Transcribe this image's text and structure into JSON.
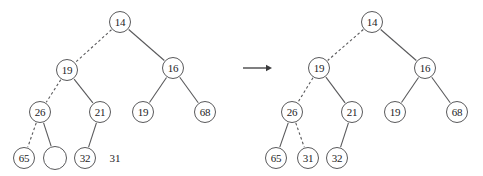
{
  "figure": {
    "kind": "binary-search-tree-insertion-diagram",
    "background_color": "#ffffff",
    "stroke_color": "#59595b",
    "text_color": "#232325",
    "node_radius": 11,
    "node_font_size": 11,
    "transition_arrow": {
      "name": "transition-arrow",
      "glyph": "→",
      "x1": 243,
      "y1": 68,
      "x2": 272,
      "y2": 68
    },
    "loose_labels": [
      {
        "id": "pending-key-31",
        "text": "31",
        "x": 115,
        "y": 158,
        "font_size": 11
      }
    ]
  },
  "trees": [
    {
      "id": "tree-before",
      "caption": "",
      "nodes": [
        {
          "id": "l-14",
          "label": "14",
          "x": 120,
          "y": 22,
          "r": 11,
          "empty": false
        },
        {
          "id": "l-19a",
          "label": "19",
          "x": 67,
          "y": 70,
          "r": 11,
          "empty": false
        },
        {
          "id": "l-16",
          "label": "16",
          "x": 173,
          "y": 68,
          "r": 11,
          "empty": false
        },
        {
          "id": "l-26",
          "label": "26",
          "x": 40,
          "y": 112,
          "r": 11,
          "empty": false
        },
        {
          "id": "l-21",
          "label": "21",
          "x": 100,
          "y": 112,
          "r": 11,
          "empty": false
        },
        {
          "id": "l-19b",
          "label": "19",
          "x": 143,
          "y": 112,
          "r": 11,
          "empty": false
        },
        {
          "id": "l-68",
          "label": "68",
          "x": 205,
          "y": 112,
          "r": 11,
          "empty": false
        },
        {
          "id": "l-65",
          "label": "65",
          "x": 24,
          "y": 158,
          "r": 11,
          "empty": false
        },
        {
          "id": "l-empty",
          "label": "",
          "x": 55,
          "y": 158,
          "r": 12,
          "empty": true
        },
        {
          "id": "l-32",
          "label": "32",
          "x": 85,
          "y": 158,
          "r": 11,
          "empty": false
        }
      ],
      "edges": [
        {
          "from": "l-14",
          "to": "l-19a",
          "style": "dashed"
        },
        {
          "from": "l-14",
          "to": "l-16",
          "style": "solid"
        },
        {
          "from": "l-19a",
          "to": "l-26",
          "style": "dashed"
        },
        {
          "from": "l-19a",
          "to": "l-21",
          "style": "solid"
        },
        {
          "from": "l-16",
          "to": "l-19b",
          "style": "solid"
        },
        {
          "from": "l-16",
          "to": "l-68",
          "style": "solid"
        },
        {
          "from": "l-26",
          "to": "l-65",
          "style": "dashed"
        },
        {
          "from": "l-26",
          "to": "l-empty",
          "style": "solid"
        },
        {
          "from": "l-21",
          "to": "l-32",
          "style": "solid"
        }
      ]
    },
    {
      "id": "tree-after",
      "caption": "",
      "nodes": [
        {
          "id": "r-14",
          "label": "14",
          "x": 372,
          "y": 22,
          "r": 11,
          "empty": false
        },
        {
          "id": "r-19a",
          "label": "19",
          "x": 319,
          "y": 68,
          "r": 11,
          "empty": false
        },
        {
          "id": "r-16",
          "label": "16",
          "x": 425,
          "y": 68,
          "r": 11,
          "empty": false
        },
        {
          "id": "r-26",
          "label": "26",
          "x": 292,
          "y": 112,
          "r": 11,
          "empty": false
        },
        {
          "id": "r-21",
          "label": "21",
          "x": 352,
          "y": 112,
          "r": 11,
          "empty": false
        },
        {
          "id": "r-19b",
          "label": "19",
          "x": 395,
          "y": 112,
          "r": 11,
          "empty": false
        },
        {
          "id": "r-68",
          "label": "68",
          "x": 457,
          "y": 112,
          "r": 11,
          "empty": false
        },
        {
          "id": "r-65",
          "label": "65",
          "x": 276,
          "y": 158,
          "r": 11,
          "empty": false
        },
        {
          "id": "r-31",
          "label": "31",
          "x": 308,
          "y": 158,
          "r": 11,
          "empty": false
        },
        {
          "id": "r-32",
          "label": "32",
          "x": 337,
          "y": 158,
          "r": 11,
          "empty": false
        }
      ],
      "edges": [
        {
          "from": "r-14",
          "to": "r-19a",
          "style": "dashed"
        },
        {
          "from": "r-14",
          "to": "r-16",
          "style": "solid"
        },
        {
          "from": "r-19a",
          "to": "r-26",
          "style": "dashed"
        },
        {
          "from": "r-19a",
          "to": "r-21",
          "style": "solid"
        },
        {
          "from": "r-16",
          "to": "r-19b",
          "style": "solid"
        },
        {
          "from": "r-16",
          "to": "r-68",
          "style": "solid"
        },
        {
          "from": "r-26",
          "to": "r-65",
          "style": "solid"
        },
        {
          "from": "r-26",
          "to": "r-31",
          "style": "dashed"
        },
        {
          "from": "r-21",
          "to": "r-32",
          "style": "solid"
        }
      ]
    }
  ]
}
